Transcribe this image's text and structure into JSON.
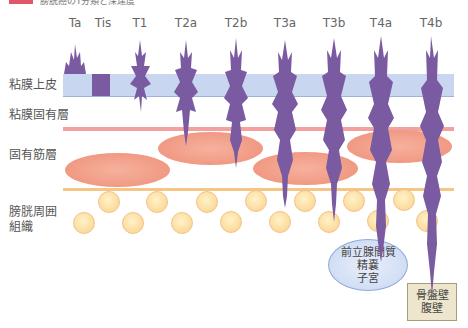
{
  "header": {
    "badge_color": "#e0566a",
    "title": "膀胱癌のT分類と深達度"
  },
  "stages": [
    {
      "label": "Ta",
      "x": 75
    },
    {
      "label": "Tis",
      "x": 103
    },
    {
      "label": "T1",
      "x": 140
    },
    {
      "label": "T2a",
      "x": 186
    },
    {
      "label": "T2b",
      "x": 236
    },
    {
      "label": "T3a",
      "x": 285
    },
    {
      "label": "T3b",
      "x": 334
    },
    {
      "label": "T4a",
      "x": 381
    },
    {
      "label": "T4b",
      "x": 431
    }
  ],
  "layers": {
    "mucosa_epithelium": "粘膜上皮",
    "lamina_propria": "粘膜固有層",
    "muscularis_propria": "固有筋層",
    "perivesical_tissue_line1": "膀胱周囲",
    "perivesical_tissue_line2": "組織"
  },
  "organs": {
    "adjacent_line1": "前立腺間質",
    "adjacent_line2": "精嚢",
    "adjacent_line3": "子宮",
    "wall_line1": "骨盤壁",
    "wall_line2": "腹壁"
  },
  "colors": {
    "tumor": "#7a5aa0",
    "mucosa": "#c8d7ef",
    "lamina_line": "#f2a0a0",
    "muscle": "#ee8f78",
    "fat": "#fbd795",
    "organ": "#c5d5f1",
    "wall": "#ede6cd"
  }
}
